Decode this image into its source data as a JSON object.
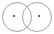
{
  "figure": {
    "kind": "venn-diagram",
    "background_color": "#ffffff",
    "canvas": {
      "width": 54,
      "height": 34
    }
  },
  "chart_data": {
    "type": "scatter",
    "xlabel": "",
    "ylabel": "",
    "xlim": [
      0,
      54
    ],
    "ylim": [
      0,
      34
    ],
    "grid": false,
    "legend": "none",
    "annotations": [],
    "sets": [
      {
        "name": "left-set",
        "cx": 17,
        "cy": 17,
        "r": 14.5,
        "stroke": "#9a9a9a",
        "stroke_width": 0.9,
        "fill": "none",
        "marker": {
          "cx": 14,
          "cy": 16,
          "r": 1.1,
          "color": "#4a4a4a"
        }
      },
      {
        "name": "right-set",
        "cx": 37,
        "cy": 17,
        "r": 14.5,
        "stroke": "#9a9a9a",
        "stroke_width": 0.9,
        "fill": "none",
        "marker": {
          "cx": 39,
          "cy": 16,
          "r": 1.1,
          "color": "#4a4a4a"
        }
      }
    ],
    "intersection": {
      "name": "lens",
      "top_point": [
        27,
        5.5
      ],
      "bottom_point": [
        27,
        28.5
      ],
      "left_extent": 24,
      "right_extent": 30
    }
  },
  "colors": {
    "stroke": "#9a9a9a",
    "dot": "#4a4a4a",
    "background": "#ffffff"
  },
  "labels": {
    "left_circle": "",
    "right_circle": "",
    "overlap": ""
  }
}
